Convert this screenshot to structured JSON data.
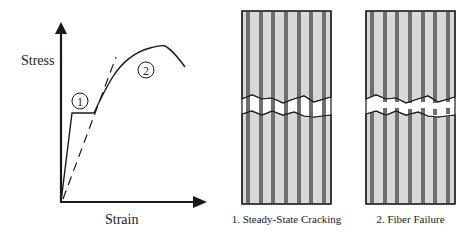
{
  "graph": {
    "y_axis_label": "Stress",
    "x_axis_label": "Strain",
    "markers": [
      {
        "id": "1",
        "label": "1"
      },
      {
        "id": "2",
        "label": "2"
      }
    ]
  },
  "panels": [
    {
      "caption": "1. Steady-State Cracking",
      "mode": "cracking"
    },
    {
      "caption": "2. Fiber Failure",
      "mode": "fiber-failure"
    }
  ],
  "colors": {
    "matrix": "#d8d8d8",
    "fiber": "#6e6e6e",
    "line": "#1a1a1a",
    "background": "#ffffff"
  }
}
